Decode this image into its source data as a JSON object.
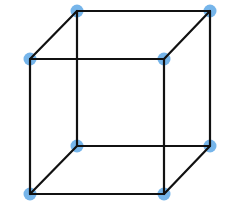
{
  "diagram": {
    "type": "wireframe-cube",
    "width": 230,
    "height": 206,
    "colors": {
      "background": "#ffffff",
      "edge": "#111111",
      "vertex": "#5ea8e6"
    },
    "edge_width": 2.2,
    "vertex_radius": 6.5,
    "vertices": [
      {
        "id": "top-back-left",
        "x": 77,
        "y": 11
      },
      {
        "id": "top-back-right",
        "x": 210,
        "y": 11
      },
      {
        "id": "top-front-left",
        "x": 30,
        "y": 59
      },
      {
        "id": "top-front-right",
        "x": 164,
        "y": 59
      },
      {
        "id": "bottom-back-left",
        "x": 77,
        "y": 146
      },
      {
        "id": "bottom-back-right",
        "x": 210,
        "y": 146
      },
      {
        "id": "bottom-front-left",
        "x": 30,
        "y": 194
      },
      {
        "id": "bottom-front-right",
        "x": 164,
        "y": 194
      }
    ],
    "edges": [
      [
        "top-back-left",
        "top-back-right"
      ],
      [
        "top-front-left",
        "top-front-right"
      ],
      [
        "top-back-left",
        "top-front-left"
      ],
      [
        "top-back-right",
        "top-front-right"
      ],
      [
        "bottom-back-left",
        "bottom-back-right"
      ],
      [
        "bottom-front-left",
        "bottom-front-right"
      ],
      [
        "bottom-back-left",
        "bottom-front-left"
      ],
      [
        "bottom-back-right",
        "bottom-front-right"
      ],
      [
        "top-back-left",
        "bottom-back-left"
      ],
      [
        "top-back-right",
        "bottom-back-right"
      ],
      [
        "top-front-left",
        "bottom-front-left"
      ],
      [
        "top-front-right",
        "bottom-front-right"
      ]
    ]
  }
}
